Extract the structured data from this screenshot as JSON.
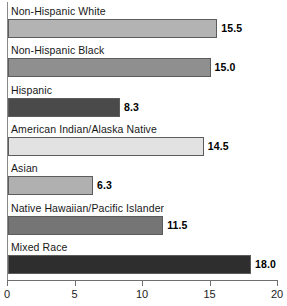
{
  "chart_data": {
    "type": "bar",
    "orientation": "horizontal",
    "title": "",
    "subtitle": "",
    "xlabel": "",
    "ylabel": "",
    "xlim": [
      0,
      20
    ],
    "grid": false,
    "legend": "none",
    "xticks": [
      "0",
      "5",
      "10",
      "15",
      "20"
    ],
    "xtick_values": [
      0,
      5,
      10,
      15,
      20
    ],
    "categories": [
      "Non-Hispanic White",
      "Non-Hispanic Black",
      "Hispanic",
      "American Indian/Alaska Native",
      "Asian",
      "Native Hawaiian/Pacific Islander",
      "Mixed Race"
    ],
    "values": [
      15.5,
      15.0,
      8.3,
      14.5,
      6.3,
      11.5,
      18.0
    ],
    "value_labels": [
      "15.5",
      "15.0",
      "8.3",
      "14.5",
      "6.3",
      "11.5",
      "18.0"
    ],
    "bar_colors": [
      "#b3b3b3",
      "#8f8f8f",
      "#4a4a4a",
      "#e2e2e2",
      "#b0b0b0",
      "#757575",
      "#2e2e2e"
    ],
    "bar_border_color": "#5c5c5c",
    "axis_color": "#6f6f6f",
    "background": "#ffffff",
    "text_color": "#171717"
  }
}
